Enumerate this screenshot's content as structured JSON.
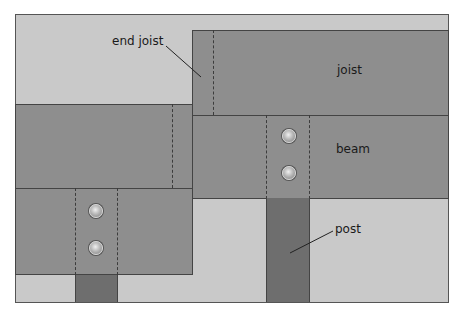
{
  "diagram": {
    "type": "deck framing plan view",
    "labels": {
      "end_joist": "end joist",
      "joist": "joist",
      "beam": "beam",
      "post": "post"
    },
    "colors": {
      "background": "#c9c9c9",
      "member": "#8e8e8e",
      "post": "#6e6e6e",
      "outline": "#444444"
    },
    "bolts_per_connection": 2,
    "connections": 2
  }
}
